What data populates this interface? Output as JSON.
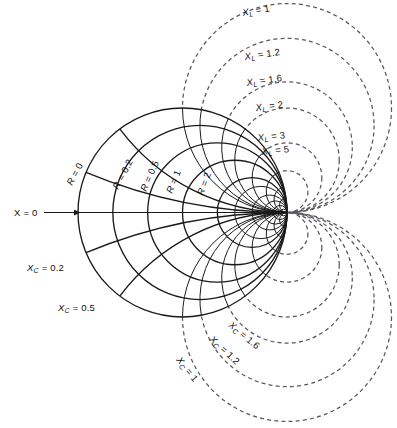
{
  "figure": {
    "kind": "smith-chart",
    "background_color": "#ffffff",
    "solid_color": "#1a1a1a",
    "dashed_color": "#585860",
    "caption_partial": ""
  },
  "axis": {
    "zero_reactance_label": "X = 0",
    "arrow_label_x": 14,
    "arrow_label_y": 213
  },
  "chart_data": {
    "type": "line",
    "xlabel": "",
    "ylabel": "",
    "grid": false,
    "legend": "inline-labels",
    "geometry": {
      "center_x": 182.5,
      "center_y": 212.5,
      "unit_radius": 104.5,
      "note": "Normalized Smith chart: resistance circle r has center (r/(1+r),0) radius 1/(1+r); reactance arc x has center (1, 1/x) radius 1/|x| in unit-circle coordinates; all curves pass through the open-circuit point at (1,0)."
    },
    "resistance_circles": {
      "series_name": "R",
      "style": "solid",
      "values": [
        0,
        0.2,
        0.5,
        1,
        2
      ],
      "labels": [
        "R = 0",
        "R = 0.2",
        "R = 0.5",
        "R = 1",
        "R = 2"
      ],
      "extra_unlabeled": [
        3,
        5,
        8,
        14,
        30
      ]
    },
    "reactance_arcs_inductive": {
      "series_name": "X_L",
      "half": "upper",
      "solid_values": [
        0.2,
        0.5
      ],
      "dashed_values": [
        1,
        1.2,
        1.6,
        2,
        3,
        5
      ],
      "labels": [
        "X_L = 1",
        "X_L = 1.2",
        "X_L = 1.6",
        "X_L = 2",
        "X_L = 3",
        "X_L = 5"
      ],
      "label_base": "X",
      "label_sub": "L",
      "label_values": [
        "1",
        "1.2",
        "1.6",
        "2",
        "3",
        "5"
      ]
    },
    "reactance_arcs_capacitive": {
      "series_name": "X_C",
      "half": "lower",
      "solid_values": [
        0.2,
        0.5
      ],
      "dashed_values": [
        1,
        1.2,
        1.6,
        2,
        3,
        5
      ],
      "solid_labels": [
        "X_C = 0.2",
        "X_C = 0.5"
      ],
      "dashed_labels": [
        "X_C = 1",
        "X_C = 1.2",
        "X_C = 1.6"
      ],
      "label_base": "X",
      "label_sub": "C",
      "solid_label_values": [
        "0.2",
        "0.5"
      ],
      "dashed_label_values": [
        "1",
        "1.2",
        "1.6"
      ]
    }
  },
  "labels": {
    "x_zero": {
      "text": "X = 0",
      "x": 14,
      "y": 216,
      "rotate": 0
    },
    "resistance": [
      {
        "key": "r0",
        "base": "R",
        "value": "0",
        "x": 72,
        "y": 186,
        "rotate": -62
      },
      {
        "key": "r02",
        "base": "R",
        "value": "0.2",
        "x": 118,
        "y": 190,
        "rotate": -62
      },
      {
        "key": "r05",
        "base": "R",
        "value": "0.5",
        "x": 146,
        "y": 192,
        "rotate": -66
      },
      {
        "key": "r1",
        "base": "R",
        "value": "1",
        "x": 172,
        "y": 194,
        "rotate": -68
      },
      {
        "key": "r2",
        "base": "R",
        "value": "2",
        "x": 203,
        "y": 196,
        "rotate": -70
      }
    ],
    "inductive": [
      {
        "key": "xl1",
        "base": "X",
        "sub": "L",
        "value": "1",
        "x": 243,
        "y": 16,
        "rotate": -10
      },
      {
        "key": "xl12",
        "base": "X",
        "sub": "L",
        "value": "1.2",
        "x": 245,
        "y": 60,
        "rotate": -8
      },
      {
        "key": "xl16",
        "base": "X",
        "sub": "L",
        "value": "1.6",
        "x": 247,
        "y": 86,
        "rotate": -8
      },
      {
        "key": "xl2",
        "base": "X",
        "sub": "L",
        "value": "2",
        "x": 256,
        "y": 111,
        "rotate": -7
      },
      {
        "key": "xl3",
        "base": "X",
        "sub": "L",
        "value": "3",
        "x": 258,
        "y": 141,
        "rotate": -6
      },
      {
        "key": "xl5",
        "base": "X",
        "sub": "L",
        "value": "5",
        "x": 262,
        "y": 155,
        "rotate": -6
      }
    ],
    "capacitive_solid": [
      {
        "key": "xc02",
        "base": "X",
        "sub": "C",
        "value": "0.2",
        "x": 27,
        "y": 271,
        "rotate": 0
      },
      {
        "key": "xc05",
        "base": "X",
        "sub": "C",
        "value": "0.5",
        "x": 58,
        "y": 311,
        "rotate": 0
      }
    ],
    "capacitive_dashed": [
      {
        "key": "xc16",
        "base": "X",
        "sub": "C",
        "value": "1.6",
        "x": 228,
        "y": 326,
        "rotate": 40
      },
      {
        "key": "xc12",
        "base": "X",
        "sub": "C",
        "value": "1.2",
        "x": 209,
        "y": 340,
        "rotate": 43
      },
      {
        "key": "xc1",
        "base": "X",
        "sub": "C",
        "value": "1",
        "x": 176,
        "y": 360,
        "rotate": 52
      }
    ]
  }
}
